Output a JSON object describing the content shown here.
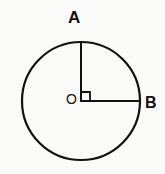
{
  "diagram": {
    "background_color": "#fafaf9",
    "stroke_color": "#111111",
    "circle": {
      "name": "circle-O",
      "center_x": 81,
      "center_y": 101,
      "radius": 59,
      "stroke_width": 2.2
    },
    "center_point": {
      "label": "O",
      "x": 81,
      "y": 101
    },
    "points": [
      {
        "label": "A",
        "x": 81,
        "y": 42,
        "position": "top"
      },
      {
        "label": "B",
        "x": 140,
        "y": 101,
        "position": "right"
      }
    ],
    "radii": [
      {
        "name": "radius-OA",
        "from": "O",
        "to": "A",
        "orientation": "vertical",
        "stroke_width": 2
      },
      {
        "name": "radius-OB",
        "from": "O",
        "to": "B",
        "orientation": "horizontal",
        "stroke_width": 2
      }
    ],
    "right_angle_marker": {
      "name": "right-angle-marker-AOB",
      "at_vertex": "O",
      "size": 9,
      "opens": "up-right",
      "angle_degrees": 90,
      "stroke_width": 1.8
    }
  }
}
